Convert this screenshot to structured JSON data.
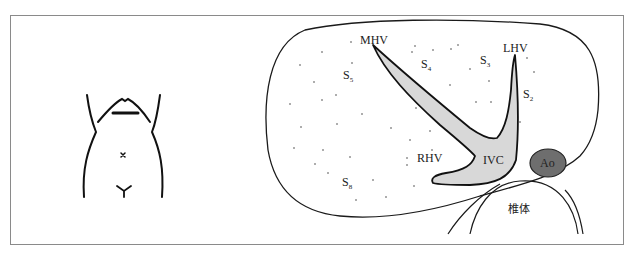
{
  "figure": {
    "type": "anatomical-diagram",
    "labels": {
      "mhv": "MHV",
      "lhv": "LHV",
      "rhv": "RHV",
      "ivc": "IVC",
      "ao": "Ao",
      "vertebra": "椎体",
      "segments": [
        {
          "base": "S",
          "sub": "5"
        },
        {
          "base": "S",
          "sub": "4"
        },
        {
          "base": "S",
          "sub": "3"
        },
        {
          "base": "S",
          "sub": "2"
        },
        {
          "base": "S",
          "sub": "8"
        }
      ]
    },
    "colors": {
      "vessel_fill": "#d8d8d8",
      "aorta_fill": "#6e6e6e",
      "outline": "#1a1a1a",
      "frame_border": "#8a8a8a"
    }
  }
}
